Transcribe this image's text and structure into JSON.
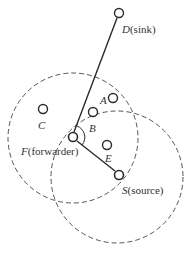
{
  "diagram": {
    "colors": {
      "stroke": "#2a2a2a",
      "dash": "#555555",
      "text": "#333333",
      "background": "#ffffff"
    },
    "ranges": [
      {
        "id": "forwarder-range",
        "center_node": "F",
        "cx": 73,
        "cy": 138,
        "r": 65
      },
      {
        "id": "source-range",
        "center_node": "S",
        "cx": 117,
        "cy": 177,
        "r": 66
      }
    ],
    "links": [
      {
        "from": "S",
        "to": "F"
      },
      {
        "from": "F",
        "to": "D"
      }
    ],
    "nodes": {
      "D": {
        "x": 119,
        "y": 13,
        "name": "D",
        "role": "(sink)"
      },
      "A": {
        "x": 113,
        "y": 98,
        "name": "A"
      },
      "B": {
        "x": 93,
        "y": 112,
        "name": "B"
      },
      "C": {
        "x": 43,
        "y": 109,
        "name": "C"
      },
      "F": {
        "x": 73,
        "y": 137,
        "name": "F",
        "role": "(forwarder)"
      },
      "E": {
        "x": 107,
        "y": 145,
        "name": "E"
      },
      "S": {
        "x": 119,
        "y": 175,
        "name": "S",
        "role": "(source)"
      }
    }
  }
}
